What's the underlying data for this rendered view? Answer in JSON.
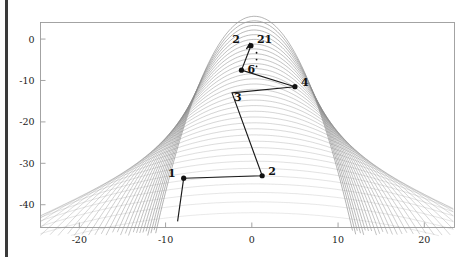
{
  "figure": {
    "background": "#ffffff",
    "frame_color": "#9a9a9a",
    "contour_color": "#8a8a8a",
    "path_color": "#1a1a1a",
    "marker_color": "#111111",
    "label_color": "#111111",
    "edge_bar_color": "#3a3a3a"
  },
  "chart_data": {
    "type": "line",
    "title": "",
    "subtitle": "",
    "xlabel": "",
    "ylabel": "",
    "grid": false,
    "legend": null,
    "xlim": [
      -24.5,
      23.5
    ],
    "ylim": [
      -45.5,
      4.0
    ],
    "xticks": [
      -20,
      -10,
      0,
      10,
      20
    ],
    "xticklabels": [
      "-20",
      "-10",
      "0",
      "10",
      "20"
    ],
    "yticks": [
      0,
      -10,
      -20,
      -30,
      -40
    ],
    "yticklabels": [
      "0",
      "-10",
      "-20",
      "-30",
      "-40"
    ],
    "background_field": {
      "description": "nested parabolic (banana-shaped) contour lines of an objective function, opening upward, densest on the left flank",
      "levels": 34,
      "vertex_x": 0.3,
      "vertex_y": -46.0
    },
    "series": [
      {
        "name": "simplex-search-path",
        "type": "line",
        "x": [
          -8.6,
          -7.9,
          1.2,
          -2.3,
          5.0,
          -1.2,
          -0.1,
          -0.6,
          -0.3,
          -0.2
        ],
        "y": [
          -44.0,
          -33.6,
          -33.0,
          -13.0,
          -11.5,
          -7.5,
          -1.6,
          -2.3,
          -1.3,
          -0.9
        ]
      }
    ],
    "points": [
      {
        "label": "1",
        "x": -7.9,
        "y": -33.6,
        "marker": true,
        "label_dx": -8,
        "label_dy": -1
      },
      {
        "label": "2",
        "x": 1.2,
        "y": -33.0,
        "marker": true,
        "label_dx": 6,
        "label_dy": -1
      },
      {
        "label": "3",
        "x": -2.3,
        "y": -13.0,
        "marker": false,
        "label_dx": 2,
        "label_dy": 8
      },
      {
        "label": "4",
        "x": 5.0,
        "y": -11.5,
        "marker": true,
        "label_dx": 6,
        "label_dy": -1
      },
      {
        "label": "6",
        "x": -1.2,
        "y": -7.5,
        "marker": true,
        "label_dx": 6,
        "label_dy": 3
      },
      {
        "label": "2",
        "x": -0.1,
        "y": -1.6,
        "marker": false,
        "label_dx": -11,
        "label_dy": -3
      },
      {
        "label": "21",
        "x": -0.1,
        "y": -1.6,
        "marker": true,
        "label_dx": 6,
        "label_dy": -3
      }
    ],
    "ellipsis": {
      "label": "vertical-dots-omitted-iterations",
      "x": 0.55,
      "y_top": -3.3,
      "y_bottom": -6.6,
      "count": 3
    },
    "annotations": [
      "Point labels 1, 2, 3, 4, 6 and 21 mark successive iterates of the search.",
      "Vertical dots between 6 and 21 indicate omitted intermediate iterations."
    ]
  }
}
